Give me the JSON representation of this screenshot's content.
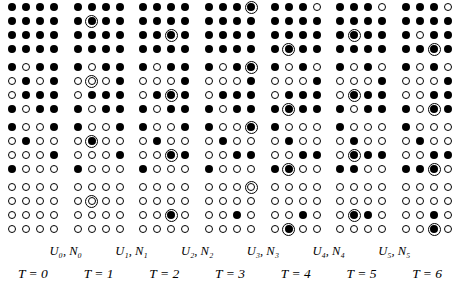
{
  "figure": {
    "type": "lattice-diagram",
    "colors": {
      "filled": "#000000",
      "empty": "#ffffff",
      "outline": "#000000",
      "background": "#ffffff"
    },
    "grid": {
      "columns": 7,
      "bands_per_column": 4,
      "rows_per_band": 4,
      "cols_per_band": 4
    }
  },
  "time_labels": [
    "T = 0",
    "T = 1",
    "T = 2",
    "T = 3",
    "T = 4",
    "T = 5",
    "T = 6"
  ],
  "transition_labels": [
    "U₀, N₀",
    "U₁, N₁",
    "U₂, N₂",
    "U₃, N₃",
    "U₄, N₄",
    "U₅, N₅"
  ],
  "columns": [
    {
      "time": "T = 0",
      "marker": null,
      "bands": [
        [
          [
            1,
            1,
            1,
            1
          ],
          [
            1,
            1,
            1,
            1
          ],
          [
            1,
            1,
            1,
            1
          ],
          [
            1,
            1,
            1,
            1
          ]
        ],
        [
          [
            1,
            0,
            1,
            1
          ],
          [
            0,
            1,
            0,
            1
          ],
          [
            0,
            1,
            1,
            1
          ],
          [
            1,
            0,
            1,
            1
          ]
        ],
        [
          [
            1,
            0,
            0,
            1
          ],
          [
            0,
            1,
            0,
            0
          ],
          [
            0,
            0,
            0,
            1
          ],
          [
            1,
            0,
            0,
            0
          ]
        ],
        [
          [
            0,
            0,
            0,
            0
          ],
          [
            0,
            0,
            0,
            0
          ],
          [
            0,
            0,
            0,
            0
          ],
          [
            0,
            0,
            0,
            0
          ]
        ]
      ]
    },
    {
      "time": "T = 1",
      "marker": {
        "row": 2,
        "col": 2
      },
      "bands": [
        [
          [
            1,
            1,
            1,
            1
          ],
          [
            1,
            1,
            1,
            1
          ],
          [
            1,
            1,
            1,
            1
          ],
          [
            1,
            1,
            1,
            1
          ]
        ],
        [
          [
            1,
            0,
            1,
            1
          ],
          [
            0,
            0,
            0,
            1
          ],
          [
            0,
            1,
            1,
            1
          ],
          [
            1,
            0,
            1,
            1
          ]
        ],
        [
          [
            1,
            0,
            0,
            1
          ],
          [
            0,
            1,
            0,
            0
          ],
          [
            0,
            0,
            0,
            1
          ],
          [
            1,
            0,
            0,
            0
          ]
        ],
        [
          [
            0,
            0,
            0,
            0
          ],
          [
            0,
            0,
            0,
            0
          ],
          [
            0,
            0,
            0,
            0
          ],
          [
            0,
            0,
            0,
            0
          ]
        ]
      ]
    },
    {
      "time": "T = 2",
      "marker": {
        "row": 3,
        "col": 3
      },
      "bands": [
        [
          [
            1,
            1,
            1,
            1
          ],
          [
            1,
            1,
            1,
            1
          ],
          [
            1,
            1,
            1,
            1
          ],
          [
            1,
            1,
            1,
            1
          ]
        ],
        [
          [
            1,
            0,
            1,
            1
          ],
          [
            0,
            0,
            0,
            1
          ],
          [
            0,
            1,
            1,
            1
          ],
          [
            1,
            0,
            1,
            1
          ]
        ],
        [
          [
            1,
            0,
            0,
            1
          ],
          [
            0,
            1,
            0,
            0
          ],
          [
            0,
            0,
            1,
            1
          ],
          [
            1,
            0,
            0,
            0
          ]
        ],
        [
          [
            0,
            0,
            0,
            0
          ],
          [
            0,
            0,
            0,
            0
          ],
          [
            0,
            0,
            1,
            0
          ],
          [
            0,
            0,
            0,
            0
          ]
        ]
      ]
    },
    {
      "time": "T = 3",
      "marker": {
        "row": 1,
        "col": 4
      },
      "bands": [
        [
          [
            1,
            1,
            1,
            1
          ],
          [
            1,
            1,
            1,
            1
          ],
          [
            1,
            1,
            1,
            1
          ],
          [
            1,
            1,
            1,
            1
          ]
        ],
        [
          [
            1,
            0,
            1,
            1
          ],
          [
            0,
            0,
            0,
            1
          ],
          [
            0,
            1,
            1,
            1
          ],
          [
            1,
            0,
            1,
            1
          ]
        ],
        [
          [
            1,
            0,
            0,
            1
          ],
          [
            0,
            1,
            0,
            0
          ],
          [
            0,
            0,
            1,
            1
          ],
          [
            1,
            0,
            0,
            0
          ]
        ],
        [
          [
            0,
            0,
            0,
            0
          ],
          [
            0,
            0,
            0,
            0
          ],
          [
            0,
            0,
            1,
            0
          ],
          [
            0,
            0,
            0,
            0
          ]
        ]
      ]
    },
    {
      "time": "T = 4",
      "marker": {
        "row": 4,
        "col": 2
      },
      "bands": [
        [
          [
            1,
            1,
            1,
            0
          ],
          [
            1,
            1,
            1,
            1
          ],
          [
            1,
            1,
            1,
            1
          ],
          [
            1,
            1,
            1,
            1
          ]
        ],
        [
          [
            1,
            0,
            1,
            0
          ],
          [
            0,
            0,
            0,
            1
          ],
          [
            0,
            1,
            1,
            1
          ],
          [
            1,
            1,
            1,
            1
          ]
        ],
        [
          [
            1,
            0,
            0,
            0
          ],
          [
            0,
            1,
            0,
            0
          ],
          [
            0,
            0,
            1,
            1
          ],
          [
            1,
            1,
            0,
            0
          ]
        ],
        [
          [
            0,
            0,
            0,
            0
          ],
          [
            0,
            0,
            0,
            0
          ],
          [
            0,
            0,
            1,
            0
          ],
          [
            0,
            1,
            0,
            0
          ]
        ]
      ]
    },
    {
      "time": "T = 5",
      "marker": {
        "row": 3,
        "col": 2
      },
      "bands": [
        [
          [
            1,
            1,
            1,
            0
          ],
          [
            1,
            1,
            1,
            1
          ],
          [
            1,
            1,
            1,
            1
          ],
          [
            1,
            1,
            1,
            1
          ]
        ],
        [
          [
            1,
            0,
            1,
            0
          ],
          [
            0,
            0,
            0,
            1
          ],
          [
            0,
            1,
            1,
            1
          ],
          [
            1,
            0,
            1,
            1
          ]
        ],
        [
          [
            1,
            0,
            0,
            0
          ],
          [
            0,
            1,
            0,
            0
          ],
          [
            0,
            1,
            1,
            1
          ],
          [
            1,
            1,
            0,
            0
          ]
        ],
        [
          [
            0,
            0,
            0,
            0
          ],
          [
            0,
            0,
            0,
            0
          ],
          [
            0,
            1,
            1,
            0
          ],
          [
            0,
            0,
            0,
            0
          ]
        ]
      ]
    },
    {
      "time": "T = 6",
      "marker": {
        "row": 4,
        "col": 3
      },
      "bands": [
        [
          [
            1,
            1,
            1,
            0
          ],
          [
            1,
            1,
            1,
            1
          ],
          [
            1,
            0,
            1,
            1
          ],
          [
            1,
            1,
            1,
            1
          ]
        ],
        [
          [
            1,
            0,
            1,
            0
          ],
          [
            0,
            0,
            0,
            1
          ],
          [
            0,
            0,
            1,
            1
          ],
          [
            1,
            0,
            1,
            1
          ]
        ],
        [
          [
            1,
            0,
            0,
            0
          ],
          [
            0,
            1,
            0,
            0
          ],
          [
            0,
            0,
            1,
            1
          ],
          [
            1,
            1,
            1,
            0
          ]
        ],
        [
          [
            0,
            0,
            0,
            0
          ],
          [
            0,
            0,
            0,
            0
          ],
          [
            0,
            0,
            1,
            0
          ],
          [
            0,
            0,
            1,
            0
          ]
        ]
      ]
    }
  ]
}
